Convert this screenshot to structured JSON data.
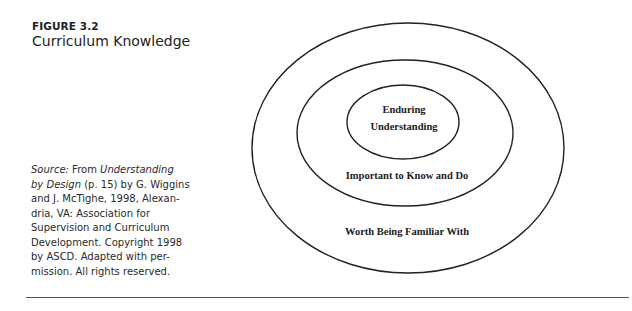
{
  "figure": {
    "label": "FIGURE 3.2",
    "title": "Curriculum Knowledge"
  },
  "source": {
    "prefix": "Source:",
    "from": " From ",
    "book_title_1": "Understanding",
    "book_title_2": "by Design",
    "rest_1": " (p. 15) by G. Wiggins",
    "line_3": "and J. McTighe, 1998, Alexan-",
    "line_4": "dria, VA: Association for",
    "line_5": "Supervision and Curriculum",
    "line_6": "Development. Copyright 1998",
    "line_7": "by ASCD. Adapted with per-",
    "line_8": "mission. All rights reserved."
  },
  "diagram": {
    "type": "nested-ellipses",
    "rings": [
      {
        "name": "outer",
        "label": "Worth Being Familiar With"
      },
      {
        "name": "middle",
        "label": "Important to Know and Do"
      },
      {
        "name": "inner",
        "label_line_1": "Enduring",
        "label_line_2": "Understanding"
      }
    ]
  }
}
